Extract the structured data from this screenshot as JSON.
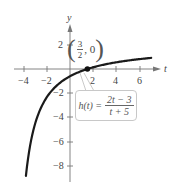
{
  "chart_data": {
    "type": "line",
    "title": "",
    "xlabel": "t",
    "ylabel": "y",
    "xlim": [
      -4.5,
      7.5
    ],
    "ylim": [
      -9,
      3
    ],
    "grid": false,
    "x_ticks": [
      -4,
      -2,
      2,
      4,
      6
    ],
    "y_ticks": [
      2,
      -2,
      -4,
      -6,
      -8
    ],
    "x_tick_labels": [
      "−4",
      "−2",
      "2",
      "4",
      "6"
    ],
    "y_tick_labels": [
      "2",
      "−2",
      "−4",
      "−6",
      "−8"
    ],
    "series": [
      {
        "name": "h(t) = (2t − 3)/(t + 5)",
        "function": "(2t-3)/(t+5)",
        "t_range": [
          -3.8,
          7
        ],
        "x": [
          -3.8,
          -3,
          -2,
          -1,
          0,
          1,
          1.5,
          2,
          3,
          4,
          5,
          6,
          7
        ],
        "y": [
          -8.83,
          -4.5,
          -2.33,
          -1.25,
          -0.6,
          -0.17,
          0,
          0.14,
          0.38,
          0.56,
          0.7,
          0.82,
          0.92
        ]
      }
    ],
    "annotations": [
      {
        "type": "point",
        "x": 1.5,
        "y": 0,
        "label": "(3/2, 0)"
      },
      {
        "type": "callout",
        "text": "h(t) = (2t − 3)/(t + 5)"
      }
    ]
  },
  "labels": {
    "x_axis": "t",
    "y_axis": "y",
    "x_ticks": [
      "−4",
      "−2",
      "2",
      "4",
      "6"
    ],
    "y_ticks": [
      "2",
      "−2",
      "−4",
      "−6",
      "−8"
    ]
  },
  "point_label": {
    "open": "(",
    "num": "3",
    "den": "2",
    "rest": ", 0",
    "close": ")"
  },
  "callout": {
    "lhs": "h(t) =",
    "num": "2t − 3",
    "den": "t + 5"
  }
}
